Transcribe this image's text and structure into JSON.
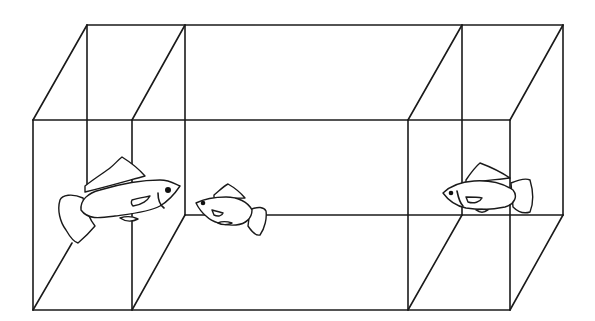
{
  "diagram": {
    "type": "tank-three-compartments",
    "colors": {
      "line": "#1a1a1a",
      "background": "#ffffff"
    },
    "compartments": [
      {
        "name": "left-compartment",
        "fish_count": 1,
        "fish_facing": "right"
      },
      {
        "name": "center-compartment",
        "fish_count": 1,
        "fish_facing": "left"
      },
      {
        "name": "right-compartment",
        "fish_count": 1,
        "fish_facing": "left"
      }
    ],
    "fish": [
      {
        "name": "large-fish-left",
        "compartment": "left",
        "size": "large",
        "facing": "right"
      },
      {
        "name": "small-fish-center",
        "compartment": "center",
        "size": "small",
        "facing": "left"
      },
      {
        "name": "medium-fish-right",
        "compartment": "right",
        "size": "medium",
        "facing": "left"
      }
    ]
  }
}
